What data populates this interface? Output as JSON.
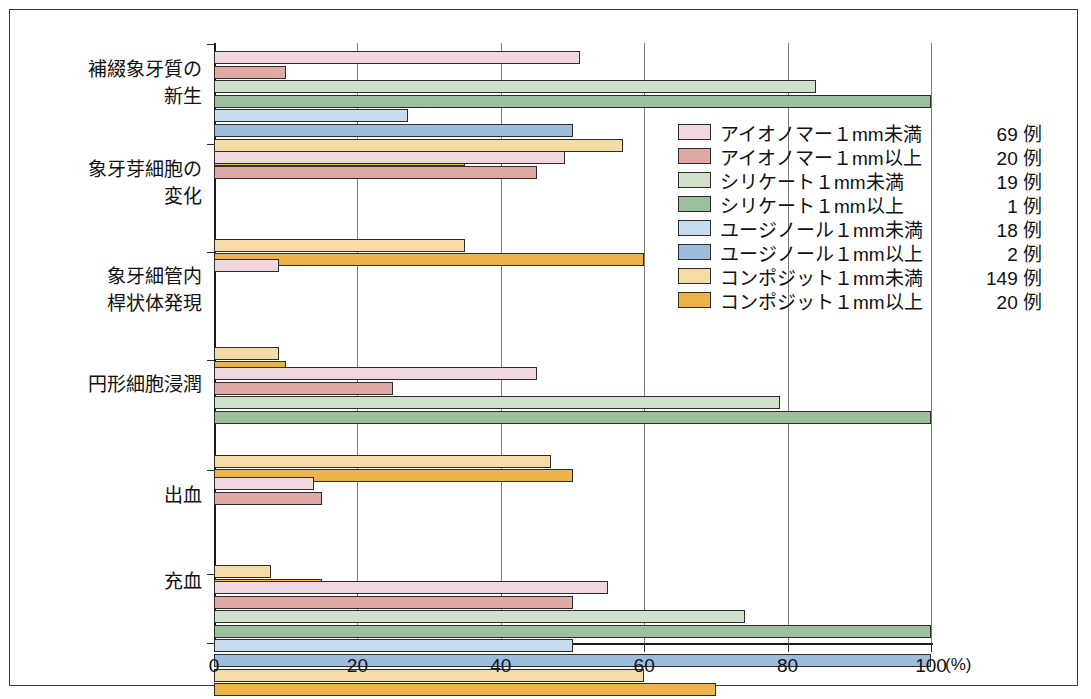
{
  "chart_data": {
    "type": "bar",
    "orientation": "horizontal",
    "title": "",
    "xlabel": "(%)",
    "ylabel": "",
    "xlim": [
      0,
      100
    ],
    "xticks": [
      0,
      20,
      40,
      60,
      80,
      100
    ],
    "xtick_labels": [
      "0",
      "20",
      "40",
      "60",
      "80",
      "100"
    ],
    "unit_label": "(%)",
    "grid": true,
    "legend_position": "upper-right",
    "categories": [
      "補綴象牙質の\n新生",
      "象牙芽細胞の\n変化",
      "象牙細管内\n桿状体発現",
      "円形細胞浸潤",
      "出血",
      "充血"
    ],
    "series": [
      {
        "name": "アイオノマー１mm未満",
        "count_label": "69 例",
        "color": "#f0d6de",
        "values": [
          51,
          49,
          9,
          45,
          14,
          55
        ]
      },
      {
        "name": "アイオノマー１mm以上",
        "count_label": "20 例",
        "color": "#e0a9a5",
        "values": [
          10,
          45,
          0,
          25,
          15,
          50
        ]
      },
      {
        "name": "シリケート１mm未満",
        "count_label": "19 例",
        "color": "#cfe1ca",
        "values": [
          84,
          0,
          0,
          79,
          0,
          74
        ]
      },
      {
        "name": "シリケート１mm以上",
        "count_label": "1 例",
        "color": "#9cbf9c",
        "values": [
          100,
          0,
          0,
          100,
          0,
          100
        ]
      },
      {
        "name": "ユージノール１mm未満",
        "count_label": "18 例",
        "color": "#c5ddef",
        "values": [
          27,
          0,
          0,
          0,
          0,
          50
        ]
      },
      {
        "name": "ユージノール１mm以上",
        "count_label": "2 例",
        "color": "#9ebcdc",
        "values": [
          50,
          0,
          0,
          0,
          0,
          100
        ]
      },
      {
        "name": "コンポジット１mm未満",
        "count_label": "149 例",
        "color": "#f5dca5",
        "values": [
          57,
          35,
          9,
          47,
          8,
          60
        ]
      },
      {
        "name": "コンポジット１mm以上",
        "count_label": "20 例",
        "color": "#eeb councils",
        "values": [
          35,
          60,
          10,
          50,
          15,
          70
        ]
      }
    ]
  }
}
